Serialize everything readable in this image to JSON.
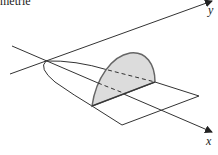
{
  "header": {
    "clipped_text": "metrie"
  },
  "diagram": {
    "type": "solid-of-known-cross-section",
    "axes": {
      "x_label": "x",
      "y_label": "y"
    },
    "base_region": "parabolic region",
    "cross_section": "semicircle perpendicular to x-axis",
    "colors": {
      "stroke": "#333333",
      "fill": "#dcdcdc",
      "background": "#ffffff"
    }
  }
}
